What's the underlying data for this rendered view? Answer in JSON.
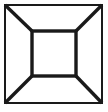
{
  "canvas": {
    "width": 108,
    "height": 112,
    "background_color": "#ffffff",
    "title": "Perspective box line drawing"
  },
  "figure": {
    "name": "one-point-perspective-box",
    "stroke_color": "#1a1a1a",
    "fill_color": "#ffffff",
    "outer_square": {
      "label": "outer-square",
      "x": 5,
      "y": 5,
      "width": 97,
      "height": 98,
      "stroke_width": 1.2
    },
    "inner_square": {
      "label": "inner-square",
      "x": 32,
      "y": 31,
      "width": 44,
      "height": 45,
      "stroke_width": 3.4
    },
    "diagonals": [
      {
        "label": "diagonal-top-left",
        "x1": 5,
        "y1": 5,
        "x2": 32,
        "y2": 31,
        "stroke_width": 3.4
      },
      {
        "label": "diagonal-top-right",
        "x1": 102,
        "y1": 5,
        "x2": 76,
        "y2": 31,
        "stroke_width": 3.4
      },
      {
        "label": "diagonal-bottom-right",
        "x1": 102,
        "y1": 103,
        "x2": 76,
        "y2": 76,
        "stroke_width": 3.4
      },
      {
        "label": "diagonal-bottom-left",
        "x1": 5,
        "y1": 103,
        "x2": 32,
        "y2": 76,
        "stroke_width": 3.4
      }
    ]
  }
}
